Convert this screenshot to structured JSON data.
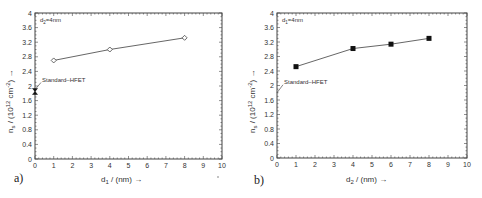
{
  "chart_data": [
    {
      "type": "line",
      "panel_label": "a)",
      "xlabel": "d1 / (nm) →",
      "ylabel": "n_s / (10^12 cm^-2) →",
      "xlim": [
        0,
        10
      ],
      "ylim": [
        0,
        4
      ],
      "xticks": [
        0,
        1,
        2,
        3,
        4,
        5,
        6,
        7,
        8,
        9,
        10
      ],
      "yticks": [
        0,
        0.4,
        0.8,
        1.2,
        1.6,
        2,
        2.4,
        2.8,
        3.2,
        3.6,
        4
      ],
      "annotation": "d2=4nm",
      "series": [
        {
          "name": "d1 variation",
          "marker": "open-diamond",
          "x": [
            1,
            4,
            8
          ],
          "y": [
            2.7,
            3.0,
            3.32
          ]
        }
      ],
      "reference": {
        "label": "Standard–HFET",
        "x": 0,
        "y": 1.85,
        "marker": "filled-bowtie"
      },
      "grid": false
    },
    {
      "type": "line",
      "panel_label": "b)",
      "xlabel": "d2 / (nm) →",
      "ylabel": "n_s / (10^12 cm^-2) →",
      "xlim": [
        0,
        10
      ],
      "ylim": [
        0,
        4
      ],
      "xticks": [
        0,
        1,
        2,
        3,
        4,
        5,
        6,
        7,
        8,
        9,
        10
      ],
      "yticks": [
        0,
        0.4,
        0.8,
        1.2,
        1.6,
        2,
        2.4,
        2.8,
        3.2,
        3.6,
        4
      ],
      "annotation": "d1=4nm",
      "series": [
        {
          "name": "d2 variation",
          "marker": "filled-square",
          "x": [
            1,
            4,
            6,
            8
          ],
          "y": [
            2.52,
            3.02,
            3.14,
            3.3
          ]
        }
      ],
      "reference": {
        "label": "Standard–HFET",
        "x": 0,
        "y": 1.8,
        "marker": "arrow"
      },
      "grid": false
    }
  ],
  "labels": {
    "a_panel": "a)",
    "b_panel": "b)",
    "a_annotation": "d",
    "a_annotation_sub": "2",
    "a_annotation_rest": "=4nm",
    "b_annotation": "d",
    "b_annotation_sub": "1",
    "b_annotation_rest": "=4nm",
    "a_xlabel_d": "d",
    "a_xlabel_sub": "1",
    "a_xlabel_rest": " / (nm) →",
    "b_xlabel_d": "d",
    "b_xlabel_sub": "2",
    "b_xlabel_rest": " / (nm) →",
    "ylabel_main": "n",
    "ylabel_sub": "s",
    "ylabel_rest": " / (10",
    "ylabel_exp": "12",
    "ylabel_rest2": " cm",
    "ylabel_exp2": "-2",
    "ylabel_end": ") →",
    "reference": "Standard–HFET"
  }
}
